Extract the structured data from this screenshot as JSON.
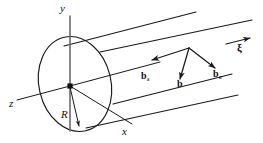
{
  "figure": {
    "background_color": "#ffffff",
    "stroke_color": "#1a1a1a",
    "axis_color": "#555555",
    "width": 263,
    "height": 143
  },
  "axes": {
    "y": {
      "label": "y"
    },
    "z": {
      "label": "z"
    },
    "x": {
      "label": "x"
    }
  },
  "geometry": {
    "radius": {
      "label": "R"
    },
    "origin": {
      "marker": "origin-dot"
    }
  },
  "vectors": {
    "screw": {
      "base": "b",
      "subscript": "s"
    },
    "total": {
      "base": "b",
      "subscript": ""
    },
    "edge": {
      "base": "b",
      "subscript": "e"
    },
    "line_direction": {
      "label": "ξ"
    }
  },
  "icons": {
    "origin_dot": "origin-dot-icon",
    "arrowhead": "arrowhead-icon"
  }
}
